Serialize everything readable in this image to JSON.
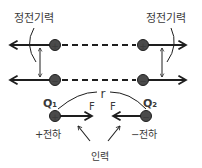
{
  "labels": {
    "electrostatic_left": "정전기력",
    "electrostatic_right": "정전기력",
    "q1": "Q₁",
    "q2": "Q₂",
    "distance": "r",
    "force_left": "F",
    "force_right": "F",
    "positive_charge": "+전하",
    "negative_charge": "−전하",
    "attraction": "인력"
  },
  "charges": {
    "top_left": "+",
    "top_right": "+",
    "bottom_left": "−",
    "bottom_right": "−",
    "q1_sign": "+",
    "q2_sign": "−"
  },
  "colors": {
    "ink": "#1e1e1e",
    "charge_fill": "#4a4a4a",
    "text": "#3a3a3a",
    "background": "#ffffff"
  }
}
